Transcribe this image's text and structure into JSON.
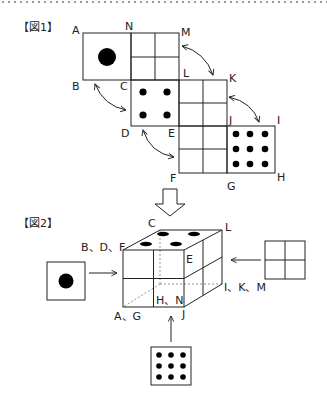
{
  "figure1": {
    "title": "【図1】",
    "vertex_labels": {
      "A": "A",
      "N": "N",
      "M": "M",
      "B": "B",
      "C": "C",
      "L": "L",
      "K": "K",
      "D": "D",
      "E": "E",
      "J": "J",
      "I": "I",
      "F": "F",
      "G": "G",
      "H": "H"
    },
    "faces": [
      {
        "name": "face-one-dot",
        "dots": 1
      },
      {
        "name": "face-grid-N-M",
        "dots": 0
      },
      {
        "name": "face-four-dots",
        "dots": 4
      },
      {
        "name": "face-grid-L-K",
        "dots": 0
      },
      {
        "name": "face-grid-E-F",
        "dots": 0
      },
      {
        "name": "face-nine-dots",
        "dots": 9
      }
    ]
  },
  "figure2": {
    "title": "【図2】",
    "labels": {
      "c": "C",
      "l": "L",
      "bdf": "B、D、F",
      "e": "E",
      "hn": "H、N",
      "ikm": "I、K、M",
      "ag": "A、G",
      "j": "J"
    },
    "views": [
      {
        "side": "left",
        "dots": 1
      },
      {
        "side": "right",
        "dots": 0
      },
      {
        "side": "bottom",
        "dots": 9
      }
    ]
  },
  "colors": {
    "stroke": "#222222",
    "dot": "#000000",
    "dash": "#777777"
  }
}
